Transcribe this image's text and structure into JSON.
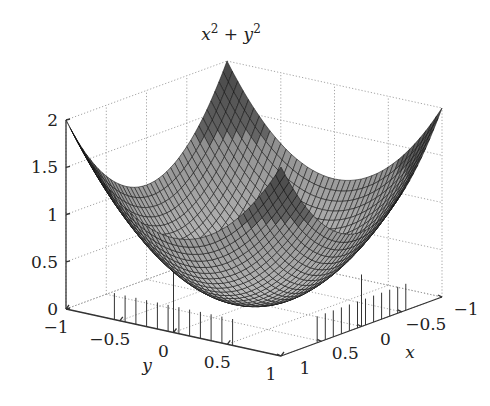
{
  "chart_data": {
    "type": "surface3d",
    "title_parts": {
      "base1": "x",
      "exp1": "2",
      "op": " + ",
      "base2": "y",
      "exp2": "2"
    },
    "function": "z = x^2 + y^2",
    "xlabel": "x",
    "ylabel": "y",
    "zlabel": "",
    "xlim": [
      -1,
      1
    ],
    "ylim": [
      -1,
      1
    ],
    "zlim": [
      0,
      2
    ],
    "x_ticks": [
      "-1",
      "-0.5",
      "0",
      "0.5",
      "1"
    ],
    "x_tick_values": [
      -1,
      -0.5,
      0,
      0.5,
      1
    ],
    "y_ticks": [
      "-1",
      "-0.5",
      "0",
      "0.5",
      "1"
    ],
    "y_tick_values": [
      -1,
      -0.5,
      0,
      0.5,
      1
    ],
    "z_ticks": [
      "0",
      "0.5",
      "1",
      "1.5",
      "2"
    ],
    "z_tick_values": [
      0,
      0.5,
      1,
      1.5,
      2
    ],
    "grid": true,
    "mesh_resolution": 41,
    "colormap": "grayscale",
    "samples": [
      {
        "x": -1,
        "y": -1,
        "z": 2
      },
      {
        "x": 1,
        "y": 1,
        "z": 2
      },
      {
        "x": -1,
        "y": 1,
        "z": 2
      },
      {
        "x": 1,
        "y": -1,
        "z": 2
      },
      {
        "x": 0,
        "y": 0,
        "z": 0
      },
      {
        "x": 0.5,
        "y": 0.5,
        "z": 0.5
      },
      {
        "x": 1,
        "y": 0,
        "z": 1
      },
      {
        "x": 0,
        "y": 1,
        "z": 1
      }
    ]
  },
  "labels": {
    "xlabel": "x",
    "ylabel": "y"
  }
}
